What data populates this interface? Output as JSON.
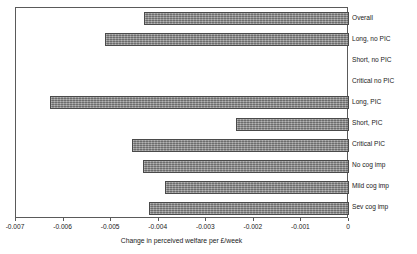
{
  "chart_data": {
    "type": "bar",
    "orientation": "horizontal",
    "title": "",
    "xlabel": "Change in perceived welfare per £/week",
    "ylabel": "",
    "xlim": [
      -0.007,
      0
    ],
    "grid": false,
    "legend": "none",
    "categories": [
      "Overall",
      "Long, no PIC",
      "Short, no PIC",
      "Critical no PIC",
      "Long, PIC",
      "Short, PIC",
      "Critical PIC",
      "No cog imp",
      "Mild cog imp",
      "Sev cog imp"
    ],
    "values": [
      -0.0043,
      -0.00513,
      0,
      0,
      -0.00628,
      -0.00238,
      -0.00456,
      -0.00433,
      -0.00387,
      -0.0042
    ],
    "xticks": [
      -0.007,
      -0.006,
      -0.005,
      -0.004,
      -0.003,
      -0.002,
      -0.001,
      0
    ],
    "xticklabels": [
      "-0.007",
      "-0.006",
      "-0.005",
      "-0.004",
      "-0.003",
      "-0.002",
      "-0.001",
      "0"
    ],
    "bar_color": "#8c8c8c",
    "bar_edge_color": "#4a4a4a",
    "axis_color": "#5a5a5a",
    "background_color": "#ffffff"
  }
}
